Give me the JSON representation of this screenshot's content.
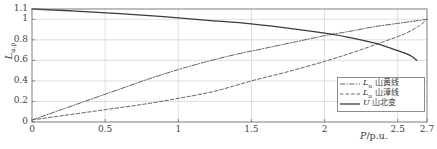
{
  "chart_data": {
    "type": "line",
    "title": "",
    "xlabel": "P/p.u.",
    "ylabel": "L/u.p",
    "xlim": [
      0,
      2.7
    ],
    "ylim": [
      0,
      1.1
    ],
    "grid": true,
    "legend_position": "bottom-right",
    "xticks": [
      "0",
      "0.5",
      "1",
      "1.5",
      "2",
      "2.5",
      "2.7"
    ],
    "xtick_values": [
      0,
      0.5,
      1,
      1.5,
      2,
      2.5,
      2.7
    ],
    "yticks": [
      "0",
      "0.2",
      "0.4",
      "0.6",
      "0.8",
      "1",
      "1.1"
    ],
    "ytick_values": [
      0,
      0.2,
      0.4,
      0.6,
      0.8,
      1,
      1.1
    ],
    "series": [
      {
        "name": "Lu_shanhuang_line",
        "label_latin": "L",
        "label_sub": "u",
        "label_cjk": "山黄线",
        "style": "dashdot",
        "color": "#555555",
        "x": [
          0,
          0.2,
          0.4,
          0.6,
          0.8,
          1.0,
          1.2,
          1.4,
          1.6,
          1.8,
          2.0,
          2.2,
          2.35,
          2.5,
          2.6,
          2.7
        ],
        "y": [
          0.02,
          0.12,
          0.22,
          0.32,
          0.42,
          0.51,
          0.59,
          0.66,
          0.72,
          0.78,
          0.84,
          0.89,
          0.93,
          0.96,
          0.98,
          1.0
        ]
      },
      {
        "name": "Lu_shanzhang_line",
        "label_latin": "L",
        "label_sub": "u",
        "label_cjk": "山漳线",
        "style": "dashed",
        "color": "#555555",
        "x": [
          0,
          0.25,
          0.5,
          0.75,
          1.0,
          1.25,
          1.5,
          1.75,
          2.0,
          2.2,
          2.4,
          2.55,
          2.65,
          2.7
        ],
        "y": [
          0.02,
          0.07,
          0.12,
          0.17,
          0.23,
          0.3,
          0.4,
          0.49,
          0.59,
          0.68,
          0.78,
          0.86,
          0.94,
          1.0
        ]
      },
      {
        "name": "U_shanbei_substation",
        "label_latin": "U",
        "label_sub": "",
        "label_cjk": "山北变",
        "style": "solid",
        "color": "#3a3a3a",
        "x": [
          0,
          0.3,
          0.6,
          0.9,
          1.2,
          1.5,
          1.8,
          2.0,
          2.2,
          2.35,
          2.45,
          2.55,
          2.6,
          2.63
        ],
        "y": [
          1.1,
          1.08,
          1.055,
          1.025,
          0.99,
          0.955,
          0.905,
          0.865,
          0.815,
          0.765,
          0.72,
          0.67,
          0.635,
          0.6
        ]
      }
    ]
  },
  "legend": {
    "entries": [
      {
        "latin": "L",
        "sub": "u",
        "cjk": " 山黄线"
      },
      {
        "latin": "L",
        "sub": "u",
        "cjk": " 山漳线"
      },
      {
        "latin": "U",
        "sub": "",
        "cjk": " 山北变"
      }
    ]
  },
  "axes": {
    "ylabel_latin": "L",
    "ylabel_sub": "u.p",
    "xlabel_latin": "P",
    "xlabel_rest": "/p.u."
  }
}
